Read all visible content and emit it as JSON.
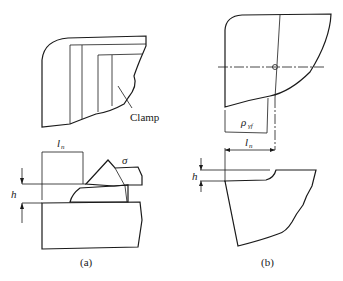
{
  "figure": {
    "panel_a": {
      "caption": "(a)",
      "clamp_label": "Clamp",
      "dim_length_label": "l",
      "dim_length_sub": "n",
      "dim_height_label": "h",
      "sigma_label": "σ"
    },
    "panel_b": {
      "caption": "(b)",
      "radius_label": "ρ",
      "radius_sub": "γf",
      "dim_length_label": "l",
      "dim_length_sub": "n",
      "dim_height_label": "h"
    },
    "colors": {
      "line": "#1a1a1a",
      "background": "#ffffff"
    }
  }
}
